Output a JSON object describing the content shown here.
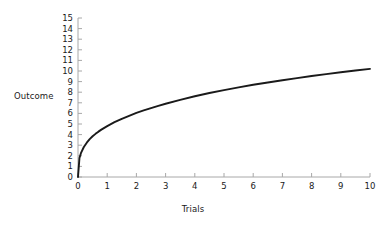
{
  "chart_data": {
    "type": "line",
    "title": "",
    "xlabel": "Trials",
    "ylabel": "Outcome",
    "xlim": [
      0,
      10
    ],
    "ylim": [
      0,
      15
    ],
    "grid": false,
    "legend": null,
    "xticks": [
      "0",
      "1",
      "2",
      "3",
      "4",
      "5",
      "6",
      "7",
      "8",
      "9",
      "10"
    ],
    "yticks": [
      "0",
      "1",
      "2",
      "3",
      "4",
      "5",
      "6",
      "7",
      "8",
      "9",
      "10",
      "11",
      "12",
      "13",
      "14",
      "15"
    ],
    "series": [
      {
        "name": "Learning curve",
        "color": "#1a1a1a",
        "x": [
          0,
          0.05,
          0.1,
          0.2,
          0.3,
          0.4,
          0.5,
          0.6,
          0.7,
          0.8,
          0.9,
          1,
          1.25,
          1.5,
          1.75,
          2,
          2.25,
          2.5,
          2.75,
          3,
          3.5,
          4,
          4.5,
          5,
          5.5,
          6,
          6.5,
          7,
          7.5,
          8,
          8.5,
          9,
          9.5,
          10
        ],
        "y": [
          0,
          1.79,
          2.25,
          2.83,
          3.24,
          3.57,
          3.84,
          4.07,
          4.28,
          4.47,
          4.64,
          4.8,
          5.17,
          5.49,
          5.77,
          6.05,
          6.28,
          6.5,
          6.71,
          6.91,
          7.27,
          7.62,
          7.92,
          8.2,
          8.45,
          8.7,
          8.92,
          9.13,
          9.33,
          9.53,
          9.71,
          9.88,
          10.05,
          10.2
        ]
      }
    ],
    "axis_color": "#a8a8a8",
    "curve_color": "#1a1a1a"
  }
}
